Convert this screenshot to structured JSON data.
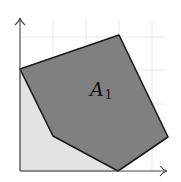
{
  "diagram": {
    "label_main": "A",
    "label_sub": "1",
    "colors": {
      "background": "#ffffff",
      "grid": "#e6e6e6",
      "light_region": "#e3e3e3",
      "polygon_fill": "#808080",
      "polygon_stroke": "#1a1a1a",
      "axis": "#444444"
    },
    "polygon_vertices": [
      [
        20,
        69
      ],
      [
        119,
        35
      ],
      [
        168,
        137
      ],
      [
        118,
        171
      ],
      [
        53,
        136
      ]
    ],
    "origin": [
      20,
      171
    ],
    "x_axis_end": [
      167,
      171
    ],
    "y_axis_end": [
      20,
      18
    ]
  }
}
